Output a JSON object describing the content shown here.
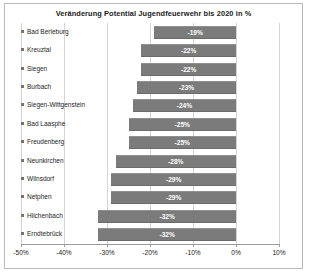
{
  "chart_data": {
    "type": "bar",
    "orientation": "horizontal",
    "title": "Veränderung Potential Jugendfeuerwehr bis 2020 in %",
    "xlabel": "",
    "ylabel": "",
    "xlim": [
      -50,
      10
    ],
    "xticks": [
      "-50%",
      "-40%",
      "-30%",
      "-20%",
      "-10%",
      "0%",
      "10%"
    ],
    "xtick_values": [
      -50,
      -40,
      -30,
      -20,
      -10,
      0,
      10
    ],
    "grid": true,
    "legend": "none",
    "bar_color": "#7b7b7b",
    "categories": [
      "Bad Berleburg",
      "Kreuztal",
      "Siegen",
      "Burbach",
      "Siegen-Wittgenstein",
      "Bad Laasphe",
      "Freudenberg",
      "Neunkirchen",
      "Wilnsdorf",
      "Netphen",
      "Hilchenbach",
      "Erndtebrück"
    ],
    "values": [
      -19,
      -22,
      -22,
      -23,
      -24,
      -25,
      -25,
      -28,
      -29,
      -29,
      -32,
      -32
    ],
    "data_labels": [
      "-19%",
      "-22%",
      "-22%",
      "-23%",
      "-24%",
      "-25%",
      "-25%",
      "-28%",
      "-29%",
      "-29%",
      "-32%",
      "-32%"
    ]
  }
}
